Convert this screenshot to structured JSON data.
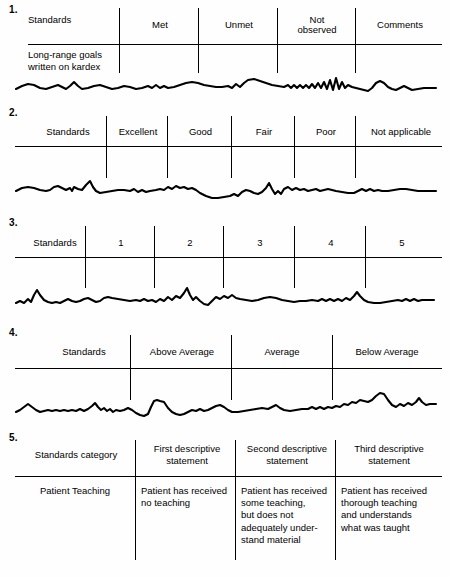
{
  "document": {
    "title": "Standards rating scale formats",
    "ink_color": "#000000",
    "background_color": "#fefefe"
  },
  "sections": [
    {
      "number": "1.",
      "row_label_top": "Standards",
      "row_label_bottom": "Long-range goals\nwritten on kardex",
      "columns": [
        "Met",
        "Unmet",
        "Not\nobserved",
        "Comments"
      ],
      "obscured_line": "handwritten-scribble-line"
    },
    {
      "number": "2.",
      "row_label_top": "Standards",
      "columns": [
        "Excellent",
        "Good",
        "Fair",
        "Poor",
        "Not applicable"
      ],
      "obscured_line": "handwritten-scribble-line"
    },
    {
      "number": "3.",
      "row_label_top": "Standards",
      "columns": [
        "1",
        "2",
        "3",
        "4",
        "5"
      ],
      "obscured_line": "handwritten-scribble-line"
    },
    {
      "number": "4.",
      "row_label_top": "Standards",
      "columns": [
        "Above Average",
        "Average",
        "Below Average"
      ],
      "obscured_line": "handwritten-scribble-line"
    },
    {
      "number": "5.",
      "row_label_top": "Standards category",
      "columns": [
        "First descriptive\nstatement",
        "Second descriptive\nstatement",
        "Third descriptive\nstatement"
      ],
      "body_row": {
        "category": "Patient Teaching",
        "cells": [
          "Patient has received\nno teaching",
          "Patient has received\nsome teaching,\nbut does not\nadequately under-\nstand material",
          "Patient has received\nthorough teaching\nand understands\nwhat was taught"
        ]
      }
    }
  ]
}
